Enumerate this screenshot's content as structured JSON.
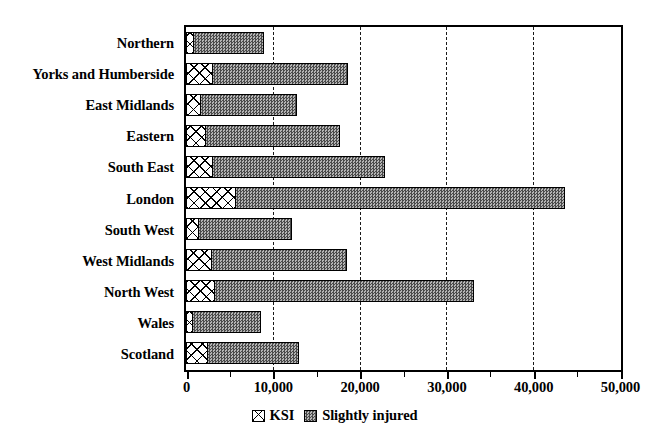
{
  "chart_data": {
    "type": "bar",
    "orientation": "horizontal",
    "stacked": true,
    "title": "",
    "subtitle": "",
    "xlabel": "",
    "ylabel": "",
    "xlim": [
      0,
      50000
    ],
    "grid": true,
    "grid_axis": "x",
    "grid_style": "dashed",
    "legend_position": "bottom",
    "x_ticks": [
      0,
      10000,
      20000,
      30000,
      40000,
      50000
    ],
    "x_tick_labels": [
      "0",
      "10,000",
      "20,000",
      "30,000",
      "40,000",
      "50,000"
    ],
    "x_minor_ticks": [
      5000,
      15000,
      25000,
      35000,
      45000
    ],
    "categories": [
      "Northern",
      "Yorks and Humberside",
      "East Midlands",
      "Eastern",
      "South East",
      "London",
      "South West",
      "West Midlands",
      "North West",
      "Wales",
      "Scotland"
    ],
    "series": [
      {
        "name": "KSI",
        "pattern": "cross-hatch",
        "color": "#ffffff",
        "values": [
          900,
          3100,
          1700,
          2300,
          3100,
          5750,
          1500,
          3000,
          3350,
          800,
          2500
        ]
      },
      {
        "name": "Slightly injured",
        "pattern": "dotted-grey",
        "color": "#8e8e8e",
        "values": [
          8100,
          15600,
          11100,
          15400,
          19800,
          37950,
          10700,
          15600,
          29850,
          7800,
          10500
        ]
      }
    ],
    "totals": [
      9000,
      18700,
      12800,
      17700,
      22900,
      43700,
      12200,
      18600,
      33200,
      8600,
      13000
    ]
  },
  "legend": {
    "items": [
      {
        "label": "KSI",
        "swatch": "cross-hatch-swatch"
      },
      {
        "label": "Slightly injured",
        "swatch": "grey-dotted-swatch"
      }
    ]
  }
}
